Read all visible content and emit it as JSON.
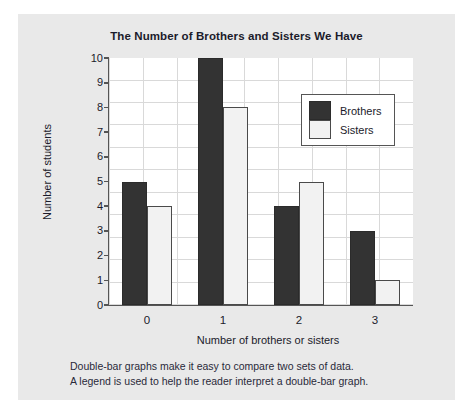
{
  "figure": {
    "panel_background": "#e9e9e9",
    "plot_background": "#ffffff",
    "caption_lines": [
      "Double-bar graphs make it easy to compare two sets of data.",
      "A legend is used to help the reader interpret a double-bar graph."
    ]
  },
  "chart_data": {
    "type": "bar",
    "title": "The Number of Brothers and Sisters We Have",
    "xlabel": "Number of brothers or sisters",
    "ylabel": "Number of students",
    "categories": [
      "0",
      "1",
      "2",
      "3"
    ],
    "series": [
      {
        "name": "Brothers",
        "color": "#333333",
        "values": [
          5,
          10,
          4,
          3
        ]
      },
      {
        "name": "Sisters",
        "color": "#f2f2f2",
        "values": [
          4,
          8,
          5,
          1
        ]
      }
    ],
    "ylim": [
      0,
      10
    ],
    "ytick_labels": [
      "0",
      "1",
      "2",
      "3",
      "4",
      "5",
      "6",
      "7",
      "8",
      "9",
      "10"
    ],
    "ytick_values": [
      0,
      1,
      2,
      3,
      4,
      5,
      6,
      7,
      8,
      9,
      10
    ],
    "grid": true,
    "legend_position": "upper right",
    "grouped": true
  }
}
